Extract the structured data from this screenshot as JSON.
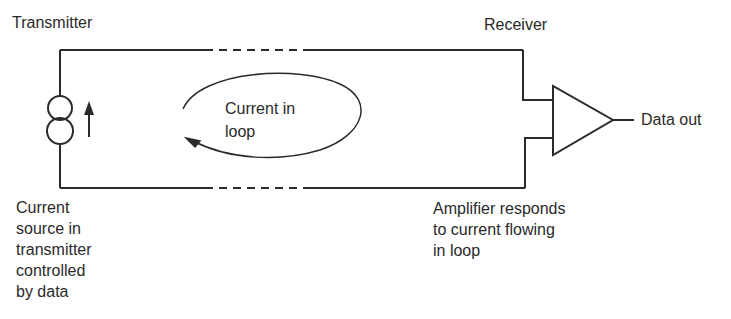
{
  "diagram": {
    "title_left": "Transmitter",
    "title_right": "Receiver",
    "loop_label": [
      "Current in",
      "loop"
    ],
    "output_label": "Data out",
    "source_caption": [
      "Current",
      "source in",
      "transmitter",
      "controlled",
      "by data"
    ],
    "amplifier_caption": [
      "Amplifier responds",
      "to current flowing",
      "in loop"
    ],
    "components": {
      "current_source": "current-source-symbol",
      "amplifier": "amplifier-triangle",
      "current_direction": "up-arrow",
      "loop_direction": "counterclockwise-arrow"
    },
    "colors": {
      "line": "#2a2a2a",
      "background": "#ffffff"
    }
  }
}
